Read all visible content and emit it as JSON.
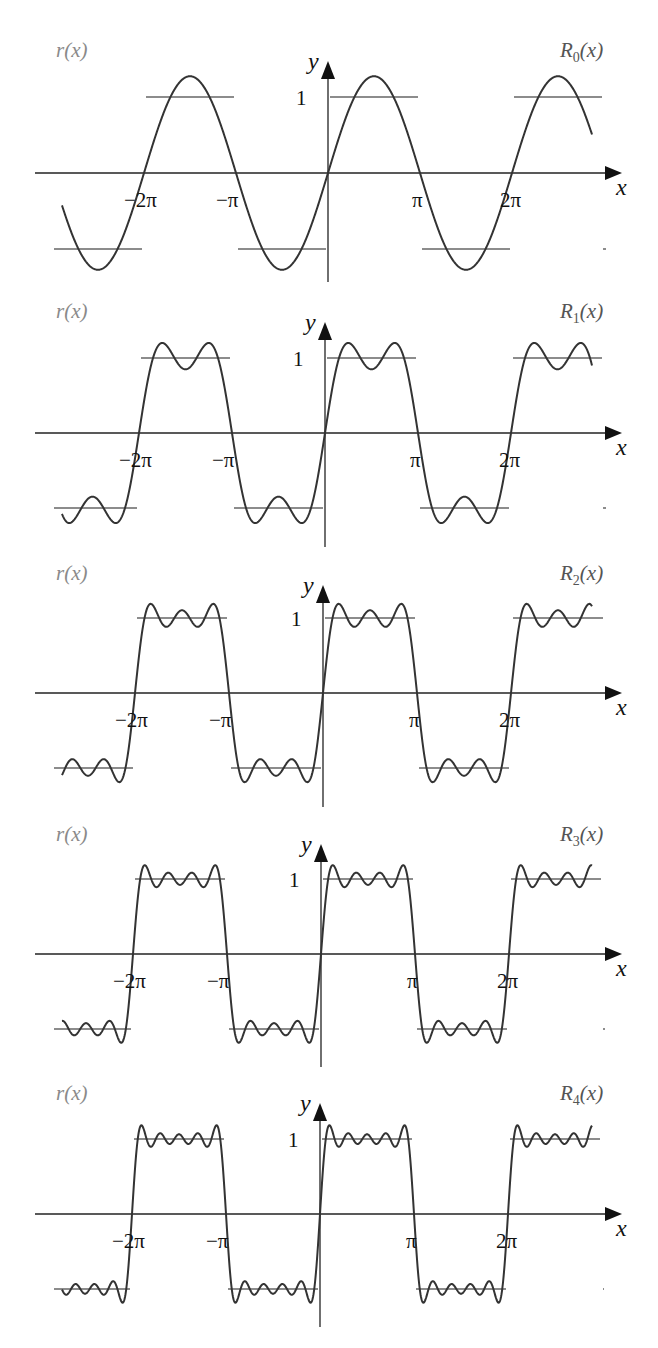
{
  "chart_data": [
    {
      "type": "line",
      "title": "",
      "left_label": "r(x)",
      "right_label": {
        "base": "R",
        "sub": "0",
        "suffix": "(x)"
      },
      "n_terms": 1,
      "xlabel": "x",
      "ylabel": "y",
      "x_ticks": [
        "−2π",
        "−π",
        "π",
        "2π"
      ],
      "y_ticks": [
        "1"
      ],
      "series": [
        {
          "name": "r(x)",
          "kind": "square-wave",
          "levels": [
            1,
            -1
          ],
          "color": "#8c8c8c"
        },
        {
          "name": "R0(x)",
          "kind": "fourier-partial-sum",
          "formula": "(4/π)·sin x",
          "color": "#333333"
        }
      ]
    },
    {
      "type": "line",
      "left_label": "r(x)",
      "right_label": {
        "base": "R",
        "sub": "1",
        "suffix": "(x)"
      },
      "n_terms": 2,
      "xlabel": "x",
      "ylabel": "y",
      "x_ticks": [
        "−2π",
        "−π",
        "π",
        "2π"
      ],
      "y_ticks": [
        "1"
      ],
      "series": [
        {
          "name": "r(x)",
          "kind": "square-wave",
          "levels": [
            1,
            -1
          ],
          "color": "#8c8c8c"
        },
        {
          "name": "R1(x)",
          "kind": "fourier-partial-sum",
          "formula": "(4/π)·[sin x + sin 3x/3]",
          "color": "#333333"
        }
      ]
    },
    {
      "type": "line",
      "left_label": "r(x)",
      "right_label": {
        "base": "R",
        "sub": "2",
        "suffix": "(x)"
      },
      "n_terms": 3,
      "xlabel": "x",
      "ylabel": "y",
      "x_ticks": [
        "−2π",
        "−π",
        "π",
        "2π"
      ],
      "y_ticks": [
        "1"
      ],
      "series": [
        {
          "name": "r(x)",
          "kind": "square-wave",
          "levels": [
            1,
            -1
          ],
          "color": "#8c8c8c"
        },
        {
          "name": "R2(x)",
          "kind": "fourier-partial-sum",
          "formula": "(4/π)·[sin x + sin 3x/3 + sin 5x/5]",
          "color": "#333333"
        }
      ]
    },
    {
      "type": "line",
      "left_label": "r(x)",
      "right_label": {
        "base": "R",
        "sub": "3",
        "suffix": "(x)"
      },
      "n_terms": 4,
      "xlabel": "x",
      "ylabel": "y",
      "x_ticks": [
        "−2π",
        "−π",
        "π",
        "2π"
      ],
      "y_ticks": [
        "1"
      ],
      "series": [
        {
          "name": "r(x)",
          "kind": "square-wave",
          "levels": [
            1,
            -1
          ],
          "color": "#8c8c8c"
        },
        {
          "name": "R3(x)",
          "kind": "fourier-partial-sum",
          "formula": "(4/π)·[sin x + … + sin 7x/7]",
          "color": "#333333"
        }
      ]
    },
    {
      "type": "line",
      "left_label": "r(x)",
      "right_label": {
        "base": "R",
        "sub": "4",
        "suffix": "(x)"
      },
      "n_terms": 5,
      "xlabel": "x",
      "ylabel": "y",
      "x_ticks": [
        "−2π",
        "−π",
        "π",
        "2π"
      ],
      "y_ticks": [
        "1"
      ],
      "series": [
        {
          "name": "r(x)",
          "kind": "square-wave",
          "levels": [
            1,
            -1
          ],
          "color": "#8c8c8c"
        },
        {
          "name": "R4(x)",
          "kind": "fourier-partial-sum",
          "formula": "(4/π)·[sin x + … + sin 9x/9]",
          "color": "#333333"
        }
      ]
    }
  ],
  "layout": {
    "panels": [
      {
        "ox": 328,
        "oy": 173,
        "unit": 76,
        "half": 92,
        "ytop": 61,
        "ybot": 282,
        "labelY": 57
      },
      {
        "ox": 325,
        "oy": 433,
        "unit": 75,
        "half": 93,
        "ytop": 322,
        "ybot": 547,
        "labelY": 318
      },
      {
        "ox": 323,
        "oy": 693,
        "unit": 75,
        "half": 94,
        "ytop": 585,
        "ybot": 807,
        "labelY": 580
      },
      {
        "ox": 321,
        "oy": 954,
        "unit": 75,
        "half": 94,
        "ytop": 844,
        "ybot": 1067,
        "labelY": 841
      },
      {
        "ox": 320,
        "oy": 1214,
        "unit": 75,
        "half": 94,
        "ytop": 1103,
        "ybot": 1327,
        "labelY": 1100
      }
    ],
    "x_axis_left": 35,
    "x_axis_right": 622,
    "curve_x_from": 62,
    "curve_x_to": 592,
    "square_x_from": 52,
    "square_x_to": 605
  }
}
